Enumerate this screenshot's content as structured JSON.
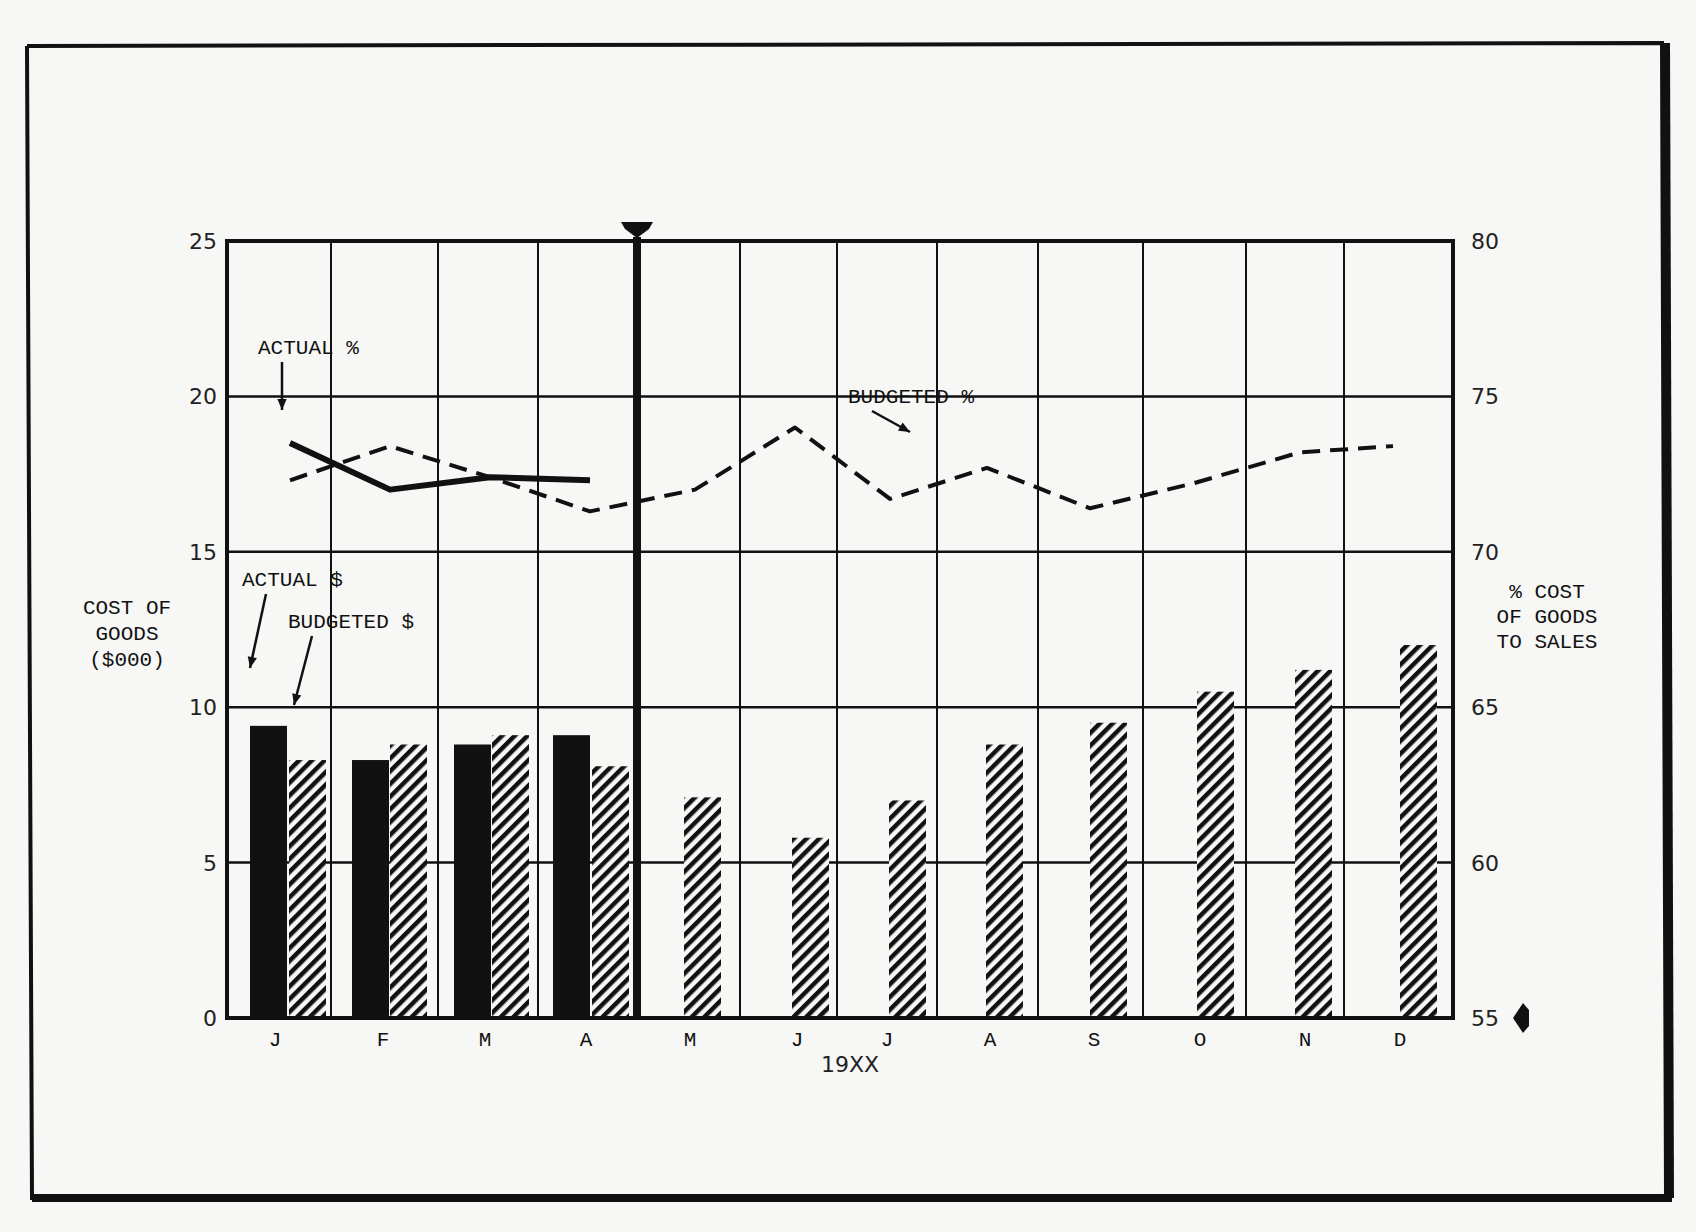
{
  "chart_data": {
    "type": "bar",
    "title": "",
    "xlabel": "19XX",
    "ylabel": "COST OF GOODS ($000)",
    "y2label": "% COST OF GOODS TO SALES",
    "categories": [
      "J",
      "F",
      "M",
      "A",
      "M",
      "J",
      "J",
      "A",
      "S",
      "O",
      "N",
      "D"
    ],
    "ylim": [
      0,
      25
    ],
    "y2lim": [
      55,
      80
    ],
    "yticks": [
      0,
      5,
      10,
      15,
      20,
      25
    ],
    "y2ticks": [
      55,
      60,
      65,
      70,
      75,
      80
    ],
    "grid": true,
    "current_month_marker_after": "A",
    "series": [
      {
        "name": "ACTUAL $",
        "kind": "bar",
        "axis": "left",
        "style": "solid-black",
        "values": [
          9.4,
          8.3,
          8.8,
          9.1,
          null,
          null,
          null,
          null,
          null,
          null,
          null,
          null
        ]
      },
      {
        "name": "BUDGETED $",
        "kind": "bar",
        "axis": "left",
        "style": "diagonal-hatch",
        "values": [
          8.3,
          8.8,
          9.1,
          8.1,
          7.1,
          5.8,
          7.0,
          8.8,
          9.5,
          10.5,
          11.2,
          12.0
        ]
      },
      {
        "name": "ACTUAL %",
        "kind": "line",
        "axis": "right",
        "style": "solid-thick",
        "values": [
          73.5,
          72.0,
          72.4,
          72.3,
          null,
          null,
          null,
          null,
          null,
          null,
          null,
          null
        ]
      },
      {
        "name": "BUDGETED %",
        "kind": "line",
        "axis": "right",
        "style": "dashed",
        "values": [
          72.3,
          73.4,
          72.4,
          71.3,
          72.0,
          74.0,
          71.7,
          72.7,
          71.4,
          72.2,
          73.2,
          73.4
        ]
      }
    ],
    "annotations": [
      {
        "text": "ACTUAL %",
        "x": 258,
        "y": 354,
        "arrow_to": [
          282,
          410
        ]
      },
      {
        "text": "BUDGETED %",
        "x": 848,
        "y": 403,
        "arrow_to": [
          910,
          432
        ]
      },
      {
        "text": "ACTUAL $",
        "x": 242,
        "y": 586,
        "arrow_to": [
          250,
          668
        ]
      },
      {
        "text": "BUDGETED $",
        "x": 288,
        "y": 628,
        "arrow_to": [
          294,
          705
        ]
      }
    ]
  },
  "labels": {
    "left_axis_title": [
      "COST OF",
      "GOODS",
      "($000)"
    ],
    "right_axis_title": [
      "% COST",
      "OF GOODS",
      "TO SALES"
    ],
    "x_axis_title": "19XX"
  },
  "layout": {
    "frame": {
      "x0": 227,
      "x1": 1453,
      "y0": 241,
      "y1": 1018
    },
    "column_lines": [
      227,
      331,
      438,
      538,
      637,
      740,
      837,
      937,
      1038,
      1143,
      1246,
      1344,
      1453
    ],
    "label_x": [
      275,
      383,
      485,
      586,
      690,
      797,
      887,
      990,
      1094,
      1200,
      1305,
      1400
    ],
    "actual_bar_x": [
      250,
      352,
      454,
      553
    ],
    "budget_bar_x": [
      289,
      390,
      492,
      592,
      684,
      792,
      889,
      986,
      1090,
      1197,
      1295,
      1400
    ],
    "bar_width": 37,
    "line_x": [
      290,
      390,
      490,
      590,
      695,
      795,
      890,
      987,
      1090,
      1193,
      1300,
      1393
    ],
    "marker_x": 637,
    "colors": {
      "ink": "#111111",
      "paper": "#f7f7f5"
    }
  }
}
